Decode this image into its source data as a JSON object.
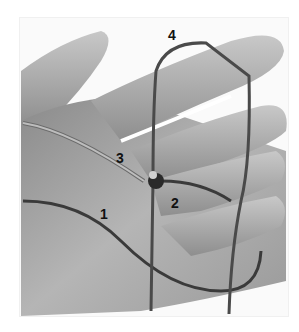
{
  "image": {
    "description": "Grayscale photo of an open hand with a cord looped around fingers forming a knot, with numbered annotations",
    "labels": [
      {
        "id": "1",
        "text": "1"
      },
      {
        "id": "2",
        "text": "2"
      },
      {
        "id": "3",
        "text": "3"
      },
      {
        "id": "4",
        "text": "4"
      }
    ]
  }
}
